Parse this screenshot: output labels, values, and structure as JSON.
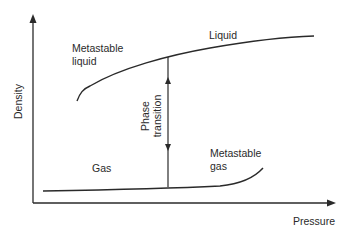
{
  "diagram": {
    "title": "",
    "axes": {
      "x_label": "Pressure",
      "y_label": "Density"
    },
    "labels": {
      "metastable_liquid_line1": "Metastable",
      "metastable_liquid_line2": "liquid",
      "liquid": "Liquid",
      "gas": "Gas",
      "metastable_gas_line1": "Metastable",
      "metastable_gas_line2": "gas",
      "phase_transition_line1": "Phase",
      "phase_transition_line2": "transition"
    },
    "curves": [
      {
        "name": "liquid-branch",
        "description": "Upper density branch: metastable liquid rising steeply then flattening into stable liquid"
      },
      {
        "name": "gas-branch",
        "description": "Lower density branch: nearly flat stable gas then rising into metastable gas"
      }
    ],
    "arrow": {
      "name": "phase-transition",
      "direction": "bidirectional vertical",
      "between": [
        "liquid",
        "gas"
      ]
    },
    "colors": {
      "line": "#2a2a2a",
      "text": "#2a2a2a",
      "background": "#ffffff"
    }
  }
}
